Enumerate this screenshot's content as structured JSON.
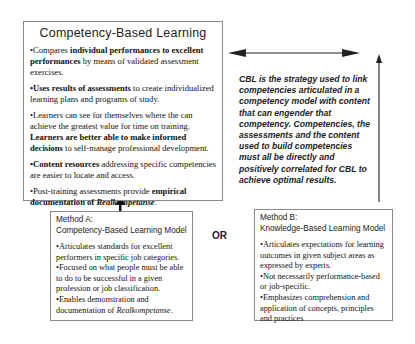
{
  "main_box": {
    "title": "Competency-Based Learning",
    "bullets": [
      {
        "parts": [
          {
            "text": "•Compares ",
            "style": "normal"
          },
          {
            "text": "individual performances to excellent performances",
            "style": "bold"
          },
          {
            "text": " by means of validated assessment exercises.",
            "style": "normal"
          }
        ]
      },
      {
        "parts": [
          {
            "text": "•Uses results of assessments",
            "style": "bold"
          },
          {
            "text": " to create individualized learning plans and programs of study.",
            "style": "normal"
          }
        ]
      },
      {
        "parts": [
          {
            "text": "•Learners can see for themselves where the can achieve the greatest value for time on training. ",
            "style": "normal"
          },
          {
            "text": "Learners are better able to make informed decisions",
            "style": "bold"
          },
          {
            "text": " to self-manage professional development.",
            "style": "normal"
          }
        ]
      },
      {
        "parts": [
          {
            "text": "•Content resources",
            "style": "bold"
          },
          {
            "text": " addressing specific competencies are easier to locate and access.",
            "style": "normal"
          }
        ]
      },
      {
        "parts": [
          {
            "text": "•Post-training assessments provide ",
            "style": "normal"
          },
          {
            "text": "empirical documentation of ",
            "style": "bold"
          },
          {
            "text": "Realkompetanse",
            "style": "bold-italic"
          },
          {
            "text": ".",
            "style": "normal"
          }
        ]
      }
    ]
  },
  "cbl_statement": "CBL is the strategy used to link competencies articulated in a competency model with content that can engender that competency. Competencies, the assessments and the content used to build competencies must all be directly and positively correlated for CBL to achieve optimal results.",
  "or_label": "OR",
  "method_a": {
    "label": "Method A:",
    "title": "Competency-Based Learning Model",
    "items": [
      "•Articulates standards for excellent performers in specific job categories.",
      "•Focused on what people must be able to do to be successful in a given profession or job classification.",
      "•Enables demonstration and documentation of "
    ],
    "italic_term": "Realkompetanse",
    "italic_suffix": "."
  },
  "method_b": {
    "label": "Method B:",
    "title": "Knowledge-Based Learning Model",
    "items": [
      "•Articulates expectations for learning outcomes in given subject areas as expressed by experts.",
      "•Not necessarily performance-based or job-specific.",
      "•Emphasizes comprehension and application of concepts, principles and practices"
    ]
  },
  "colors": {
    "border": "#8a8a8a",
    "arrow": "#222222",
    "text": "#111111"
  }
}
